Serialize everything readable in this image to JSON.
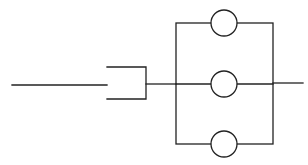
{
  "diagram": {
    "type": "parallel-circuit",
    "stroke_color": "#222222",
    "background": "#ffffff",
    "input_line": {
      "x1": 12,
      "y1": 85,
      "x2": 107,
      "y2": 85
    },
    "bracket": {
      "top_y": 67,
      "bottom_y": 99,
      "left_x": 107,
      "right_x": 146,
      "mid_y": 84
    },
    "connector": {
      "x1": 146,
      "y1": 84,
      "x2": 176,
      "y2": 84
    },
    "parallel_box": {
      "left_x": 176,
      "right_x": 273,
      "top_y": 23,
      "bottom_y": 144
    },
    "elements": [
      {
        "name": "circle-element-top",
        "cx": 224,
        "cy": 23,
        "r": 13
      },
      {
        "name": "circle-element-middle",
        "cx": 224,
        "cy": 84,
        "r": 13
      },
      {
        "name": "circle-element-bottom",
        "cx": 224,
        "cy": 144,
        "r": 13
      }
    ],
    "output_line": {
      "x1": 273,
      "y1": 83,
      "x2": 303,
      "y2": 83
    }
  }
}
